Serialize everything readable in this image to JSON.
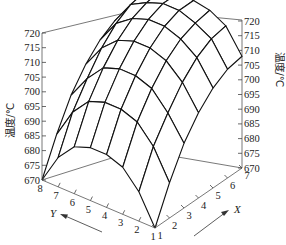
{
  "chart_data": {
    "type": "surface3d",
    "title": "",
    "zlabel": "温度/℃",
    "xlabel": "X",
    "ylabel": "Y",
    "x": [
      1,
      2,
      3,
      4,
      5,
      6,
      7
    ],
    "y": [
      1,
      2,
      3,
      4,
      5,
      6,
      7,
      8
    ],
    "zlim": [
      670,
      720
    ],
    "z_ticks": [
      670,
      675,
      680,
      685,
      690,
      695,
      700,
      705,
      710,
      715,
      720
    ],
    "grid": false,
    "z": [
      [
        670,
        680,
        686,
        688,
        688,
        686,
        680,
        670
      ],
      [
        682,
        692,
        698,
        700,
        700,
        698,
        692,
        682
      ],
      [
        692,
        700,
        706,
        708,
        708,
        706,
        700,
        692
      ],
      [
        699,
        707,
        712,
        714,
        714,
        712,
        707,
        699
      ],
      [
        704,
        712,
        716,
        718,
        718,
        716,
        712,
        704
      ],
      [
        707,
        715,
        718,
        720,
        720,
        718,
        715,
        707
      ],
      [
        708,
        716,
        719,
        720,
        720,
        719,
        716,
        708
      ]
    ]
  },
  "axes": {
    "left_z_ticks": [
      "720",
      "715",
      "710",
      "705",
      "700",
      "695",
      "690",
      "685",
      "680",
      "675",
      "670"
    ],
    "right_z_ticks": [
      "720",
      "715",
      "710",
      "705",
      "700",
      "695",
      "690",
      "685",
      "680",
      "675",
      "670"
    ],
    "y_ticks": [
      "8",
      "7",
      "6",
      "5",
      "4",
      "3",
      "2",
      "1"
    ],
    "x_ticks": [
      "1",
      "2",
      "3",
      "4",
      "5",
      "6",
      "7"
    ],
    "left_z_title": "温度/℃",
    "right_z_title": "温度/℃",
    "x_letter": "X",
    "y_letter": "Y"
  }
}
